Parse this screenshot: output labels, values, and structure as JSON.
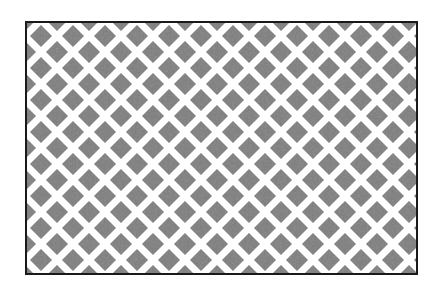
{
  "figure": {
    "label": "Diamond lattice pattern",
    "pattern": {
      "shape": "diamond",
      "period_px": 32,
      "diamond_size_px": 22,
      "offset_px": 16,
      "fill_color": "#7a7a7a",
      "background_color": "#ffffff",
      "border_color": "#1a1a1a"
    }
  }
}
